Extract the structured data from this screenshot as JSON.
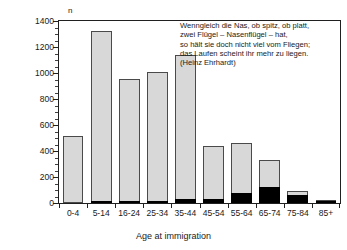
{
  "chart_data": {
    "type": "bar",
    "title": "",
    "subtitle": "",
    "xlabel": "Age at immigration",
    "ylabel": "n",
    "ylim": [
      0,
      1400
    ],
    "ytick_step": 200,
    "yticks": [
      0,
      200,
      400,
      600,
      800,
      1000,
      1200,
      1400
    ],
    "ytick_labels": [
      "0",
      "200",
      "400",
      "600",
      "800",
      "1000",
      "1200",
      "1400"
    ],
    "grid": false,
    "legend": "none",
    "categories": [
      "0-4",
      "5-14",
      "16-24",
      "25-34",
      "35-44",
      "45-54",
      "55-64",
      "65-74",
      "75-84",
      "85+"
    ],
    "series": [
      {
        "name": "total",
        "style": "light-grey-filled-bar",
        "color": "#d8d8d8",
        "values": [
          515,
          1325,
          955,
          1010,
          1140,
          435,
          460,
          330,
          95,
          20
        ]
      },
      {
        "name": "subgroup",
        "style": "black-filled-overlay-bar",
        "color": "#000000",
        "values": [
          0,
          2,
          3,
          15,
          30,
          30,
          80,
          120,
          65,
          18
        ]
      }
    ],
    "annotation": {
      "lines": [
        "Wenngleich die Nas, ob spitz, ob platt,",
        "zwei Flügel – Nasenflügel – hat,",
        "so hält sie doch nicht viel vom Fliegen;",
        "das Laufen scheint ihr mehr zu liegen.",
        "(Heinz Ehrhardt)"
      ]
    }
  },
  "colors": {
    "bar_total_fill": "#d8d8d8",
    "bar_total_stroke": "#4a4a4a",
    "bar_sub_fill": "#000000",
    "axis": "#202020",
    "text": "#1a1a1a",
    "background": "#ffffff"
  }
}
